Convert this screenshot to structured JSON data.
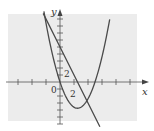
{
  "chart_data": {
    "type": "line",
    "title": "",
    "xlabel": "x",
    "ylabel": "y",
    "xlim": [
      -6,
      12
    ],
    "ylim": [
      -6,
      11
    ],
    "grid": false,
    "legend": null,
    "x_ticks_step": 2,
    "y_ticks_step": 1,
    "tick_labels": {
      "x": [
        {
          "value": 0,
          "label": "0"
        },
        {
          "value": 2,
          "label": "2"
        }
      ],
      "y": [
        {
          "value": 2,
          "label": "2"
        }
      ]
    },
    "series": [
      {
        "name": "parabola",
        "formula": "y = 0.6x^2 - 3x",
        "x": [
          -2.3,
          -1.5,
          -1,
          0,
          1,
          2,
          2.5,
          3,
          4,
          5,
          6,
          7.1
        ],
        "values": [
          10.07,
          5.85,
          3.6,
          0,
          -2.4,
          -3.6,
          -3.75,
          -3.6,
          -2.4,
          0,
          3.6,
          8.95
        ]
      },
      {
        "name": "line",
        "formula": "y = 5 - 2x",
        "x": [
          -2.4,
          0,
          2.5,
          5.7
        ],
        "values": [
          9.8,
          5,
          0,
          -6.4
        ]
      }
    ],
    "annotations": [
      {
        "text": "0",
        "at": [
          -0.4,
          -0.9
        ]
      },
      {
        "text": "2",
        "at": [
          2,
          -1.3
        ]
      },
      {
        "text": "2",
        "at": [
          0.9,
          2
        ]
      }
    ]
  },
  "labels": {
    "x_axis": "x",
    "y_axis": "y",
    "origin": "0",
    "x_two": "2",
    "y_two": "2"
  },
  "colors": {
    "plot_background": "#ececec",
    "curve": "#4a4a4a",
    "axis": "#555555"
  }
}
